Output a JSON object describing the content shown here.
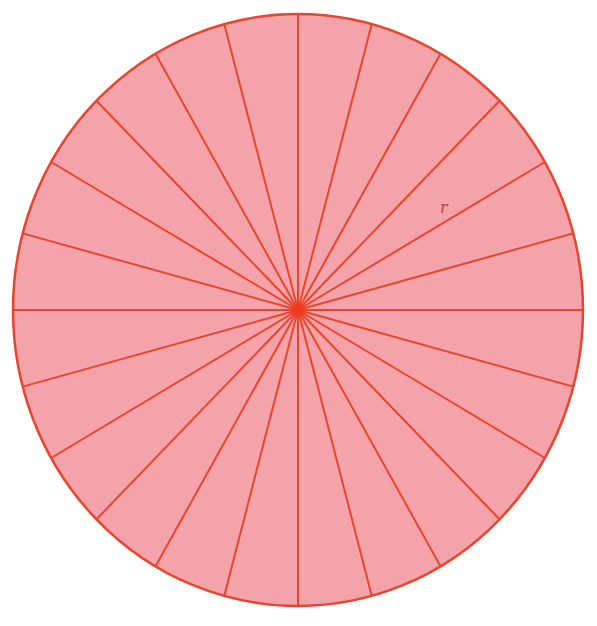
{
  "diagram": {
    "sector_count": 24,
    "center": {
      "x": 298,
      "y": 310
    },
    "radius_x": 285,
    "radius_y": 296,
    "colors": {
      "fill": "#F4A3AB",
      "stroke": "#E8452C",
      "center_dot": "#F03A1E",
      "label": "#B2453A"
    },
    "label": {
      "text": "r",
      "x": 440,
      "y": 213
    }
  }
}
